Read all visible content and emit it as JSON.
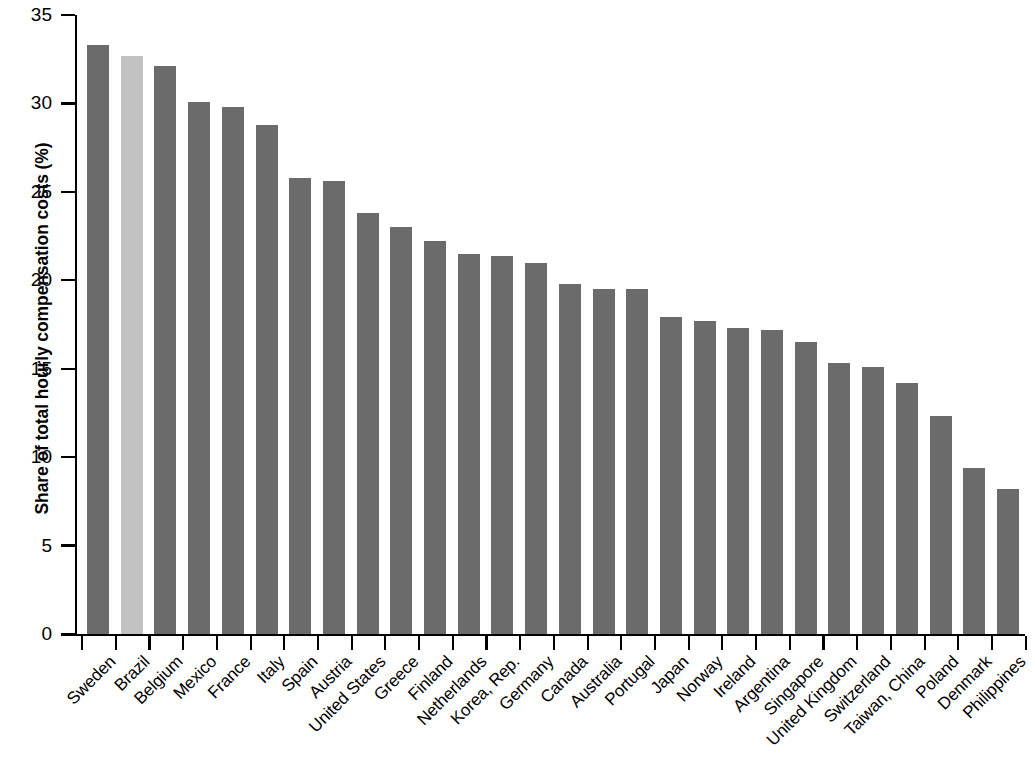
{
  "chart_data": {
    "type": "bar",
    "title": "",
    "xlabel": "",
    "ylabel": "Share of total hourly compensation costs (%)",
    "ylim": [
      0,
      35
    ],
    "yticks": [
      0,
      5,
      10,
      15,
      20,
      25,
      30,
      35
    ],
    "grid": false,
    "legend": "none",
    "highlight_category": "Brazil",
    "colors": {
      "bar": "#6b6b6b",
      "highlight_bar": "#c2c2c2",
      "axis": "#000000",
      "text": "#000000",
      "background": "#ffffff"
    },
    "categories": [
      "Sweden",
      "Brazil",
      "Belgium",
      "Mexico",
      "France",
      "Italy",
      "Spain",
      "Austria",
      "United States",
      "Greece",
      "Finland",
      "Netherlands",
      "Korea, Rep.",
      "Germany",
      "Canada",
      "Australia",
      "Portugal",
      "Japan",
      "Norway",
      "Ireland",
      "Argentina",
      "Singapore",
      "United Kingdom",
      "Switzerland",
      "Taiwan, China",
      "Poland",
      "Denmark",
      "Philippines"
    ],
    "values": [
      33.3,
      32.7,
      32.1,
      30.1,
      29.8,
      28.8,
      25.8,
      25.6,
      23.8,
      23.0,
      22.2,
      21.5,
      21.4,
      21.0,
      19.8,
      19.5,
      19.5,
      17.9,
      17.7,
      17.3,
      17.2,
      16.5,
      15.3,
      15.1,
      14.2,
      12.3,
      9.4,
      8.2
    ]
  }
}
